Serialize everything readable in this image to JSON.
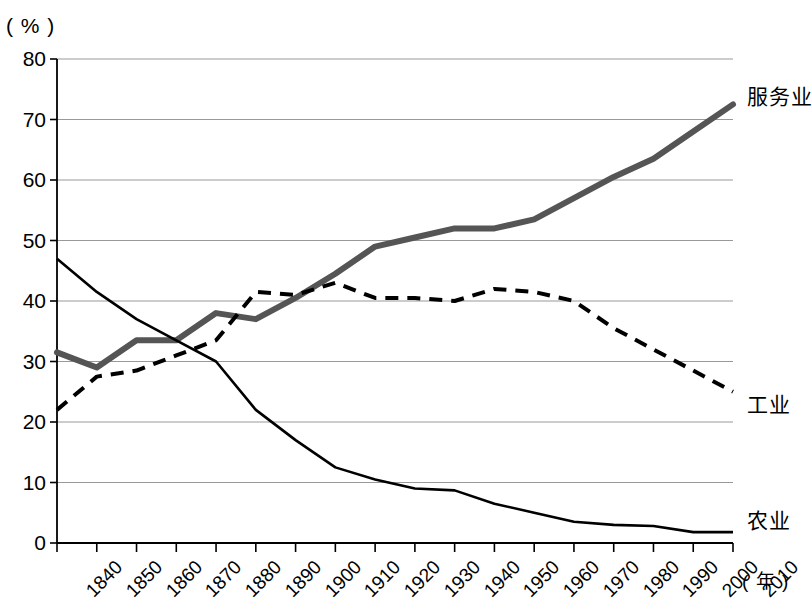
{
  "axes": {
    "y_unit": "( % )",
    "x_unit": "( 年 )",
    "y_ticks": [
      "0",
      "10",
      "20",
      "30",
      "40",
      "50",
      "60",
      "70",
      "80"
    ],
    "x_ticks": [
      "1840",
      "1850",
      "1860",
      "1870",
      "1880",
      "1890",
      "1900",
      "1910",
      "1920",
      "1930",
      "1940",
      "1950",
      "1960",
      "1970",
      "1980",
      "1990",
      "2000",
      "2010"
    ]
  },
  "series_labels": {
    "services": "服务业",
    "industry": "工业",
    "agriculture": "农业"
  },
  "colors": {
    "services_line": "#555555",
    "industry_line": "#000000",
    "agriculture_line": "#000000",
    "grid": "#999999",
    "axis": "#000000"
  },
  "chart_data": {
    "type": "line",
    "title": "",
    "xlabel": "( 年 )",
    "ylabel": "( % )",
    "xlim": [
      1840,
      2010
    ],
    "ylim": [
      0,
      80
    ],
    "grid": true,
    "legend": "inline-right-of-line-ends",
    "categories": [
      1840,
      1850,
      1860,
      1870,
      1880,
      1890,
      1900,
      1910,
      1920,
      1930,
      1940,
      1950,
      1960,
      1970,
      1980,
      1990,
      2000,
      2010
    ],
    "series": [
      {
        "name": "服务业",
        "style": "thick-solid-gray",
        "values": [
          31.5,
          29.0,
          33.5,
          33.5,
          38.0,
          37.0,
          40.5,
          44.5,
          49.0,
          50.5,
          52.0,
          52.0,
          53.5,
          57.0,
          60.5,
          63.5,
          68.0,
          72.5
        ]
      },
      {
        "name": "工业",
        "style": "dashed-black",
        "values": [
          22.0,
          27.5,
          28.5,
          31.0,
          33.5,
          41.5,
          41.0,
          43.0,
          40.5,
          40.5,
          40.0,
          42.0,
          41.5,
          40.0,
          35.5,
          32.0,
          28.5,
          25.0
        ]
      },
      {
        "name": "农业",
        "style": "thin-solid-black",
        "values": [
          47.0,
          41.5,
          37.0,
          33.5,
          30.0,
          22.0,
          17.0,
          12.5,
          10.5,
          9.0,
          8.7,
          6.5,
          5.0,
          3.5,
          3.0,
          2.8,
          1.8,
          1.8
        ]
      }
    ]
  }
}
